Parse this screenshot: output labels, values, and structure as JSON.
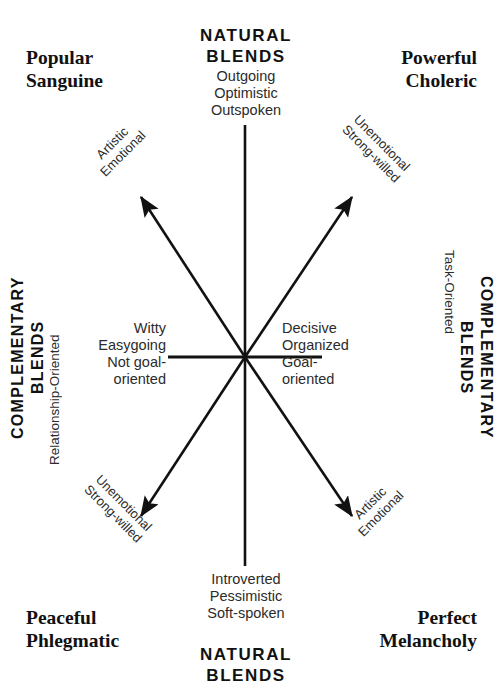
{
  "diagram": {
    "line_color": "#111111",
    "text_color": "#2b2b2b",
    "background": "#ffffff",
    "center": {
      "x": 245,
      "y": 357
    }
  },
  "corners": {
    "top_left": "Popular\nSanguine",
    "top_right": "Powerful\nCholeric",
    "bottom_left": "Peaceful\nPhlegmatic",
    "bottom_right": "Perfect\nMelancholy"
  },
  "natural_blends": {
    "top_heading": "NATURAL\nBLENDS",
    "bottom_heading": "NATURAL\nBLENDS",
    "top_traits": "Outgoing\nOptimistic\nOutspoken",
    "bottom_traits": "Introverted\nPessimistic\nSoft-spoken"
  },
  "complementary_blends": {
    "left_heading": "COMPLEMENTARY\nBLENDS",
    "left_subtitle": "Relationship-Oriented",
    "right_heading": "COMPLEMENTARY\nBLENDS",
    "right_subtitle": "Task-Oriented"
  },
  "axis_traits": {
    "left": "Witty\nEasygoing\nNot goal-\noriented",
    "right": "Decisive\nOrganized\nGoal-\noriented"
  },
  "diagonal_labels": {
    "top_left": "Artistic\nEmotional",
    "top_right": "Unemotional\nStrong-willed",
    "bottom_left": "Unemotional\nStrong-willed",
    "bottom_right": "Artistic\nEmotional"
  }
}
